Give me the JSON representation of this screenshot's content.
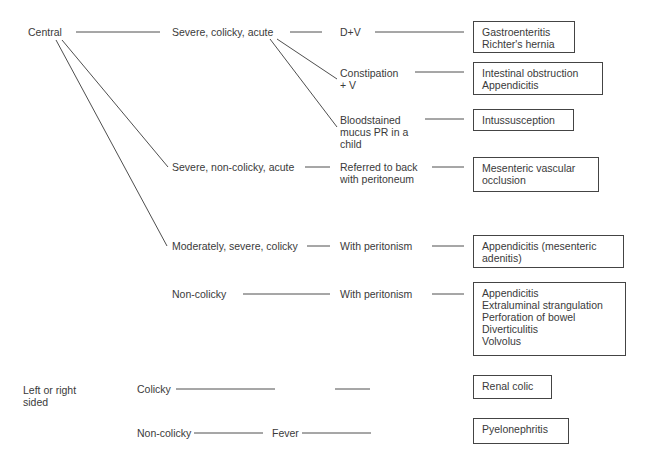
{
  "diagram": {
    "type": "decision-tree",
    "topic": "Abdominal pain differential diagnosis",
    "location": {
      "central": "Central",
      "lateral": "Left or right\nsided"
    },
    "pain_types": {
      "severe_colicky_acute": "Severe, colicky, acute",
      "severe_noncolicky_acute": "Severe, non-colicky, acute",
      "moderately_severe_colicky": "Moderately, severe, colicky",
      "noncolicky_central": "Non-colicky",
      "colicky_lateral": "Colicky",
      "noncolicky_lateral": "Non-colicky"
    },
    "features": {
      "dv": "D+V",
      "constipation_v": "Constipation\n+ V",
      "bloodstained": "Bloodstained\nmucus PR in a\nchild",
      "referred_back": "Referred to back\nwith peritoneum",
      "with_peritonism_1": "With peritonism",
      "with_peritonism_2": "With peritonism",
      "fever": "Fever"
    },
    "diagnoses": {
      "gastro": "Gastroenteritis\nRichter's hernia",
      "obstruction": "Intestinal obstruction\nAppendicitis",
      "intussusception": "Intussusception",
      "mesenteric": "Mesenteric vascular\nocclusion",
      "appendicitis_mesenteric": "Appendicitis (mesenteric\nadenitis)",
      "peritonism_list": "Appendicitis\nExtraluminal strangulation\nPerforation of bowel\nDiverticulitis\nVolvolus",
      "renal_colic": "Renal colic",
      "pyelonephritis": "Pyelonephritis"
    }
  }
}
